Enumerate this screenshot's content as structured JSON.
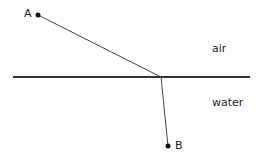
{
  "labels": {
    "point_a": "A",
    "point_b": "B",
    "medium_top": "air",
    "medium_bottom": "water"
  },
  "colors": {
    "line": "#333333",
    "text": "#222222"
  }
}
